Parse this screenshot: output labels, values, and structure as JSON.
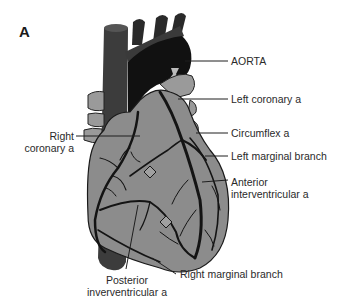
{
  "figure": {
    "panel_label": "A",
    "colors": {
      "heart_fill": "#8c8c8c",
      "vessel_dark": "#141414",
      "great_vessel": "#3c3c3c",
      "leader_line": "#1e1e1e",
      "background": "#ffffff"
    }
  },
  "labels": {
    "aorta": "AORTA",
    "left_coronary": "Left coronary a",
    "right_coronary_line1": "Right",
    "right_coronary_line2": "coronary a",
    "circumflex": "Circumflex a",
    "left_marginal": "Left marginal branch",
    "anterior_iv_line1": "Anterior",
    "anterior_iv_line2": "interventricular a",
    "right_marginal": "Right marginal branch",
    "posterior_iv_line1": "Posterior",
    "posterior_iv_line2": "inverventricular a"
  }
}
